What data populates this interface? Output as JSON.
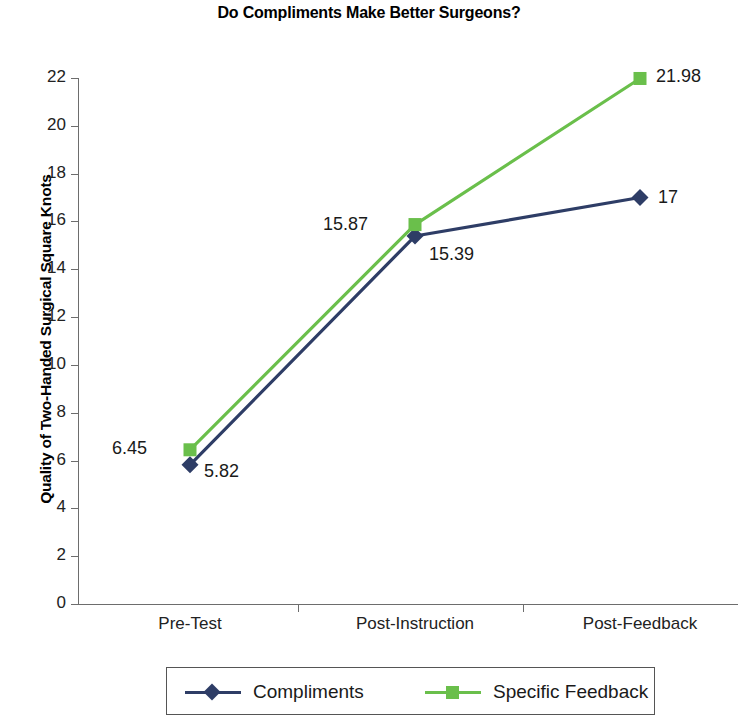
{
  "chart_data": {
    "type": "line",
    "title": "Do Compliments Make Better Surgeons?",
    "xlabel": "",
    "ylabel": "Quality of Two-Handed Surgical Square Knots",
    "categories": [
      "Pre-Test",
      "Post-Instruction",
      "Post-Feedback"
    ],
    "ylim": [
      0,
      22
    ],
    "yticks": [
      "0",
      "2",
      "4",
      "6",
      "8",
      "10",
      "12",
      "14",
      "16",
      "18",
      "20",
      "22"
    ],
    "grid": false,
    "legend_position": "bottom",
    "series": [
      {
        "name": "Compliments",
        "color": "#2e3d66",
        "marker": "diamond",
        "values": [
          5.82,
          15.39,
          17
        ],
        "point_labels": [
          "5.82",
          "15.39",
          "17"
        ]
      },
      {
        "name": "Specific Feedback",
        "color": "#6abf4b",
        "marker": "square",
        "values": [
          6.45,
          15.87,
          21.98
        ],
        "point_labels": [
          "6.45",
          "15.87",
          "21.98"
        ]
      }
    ]
  },
  "colors": {
    "compliments": "#2e3d66",
    "specific_feedback": "#6abf4b",
    "axis": "#6d6d6d",
    "text": "#1a1a1a",
    "background": "#ffffff"
  }
}
